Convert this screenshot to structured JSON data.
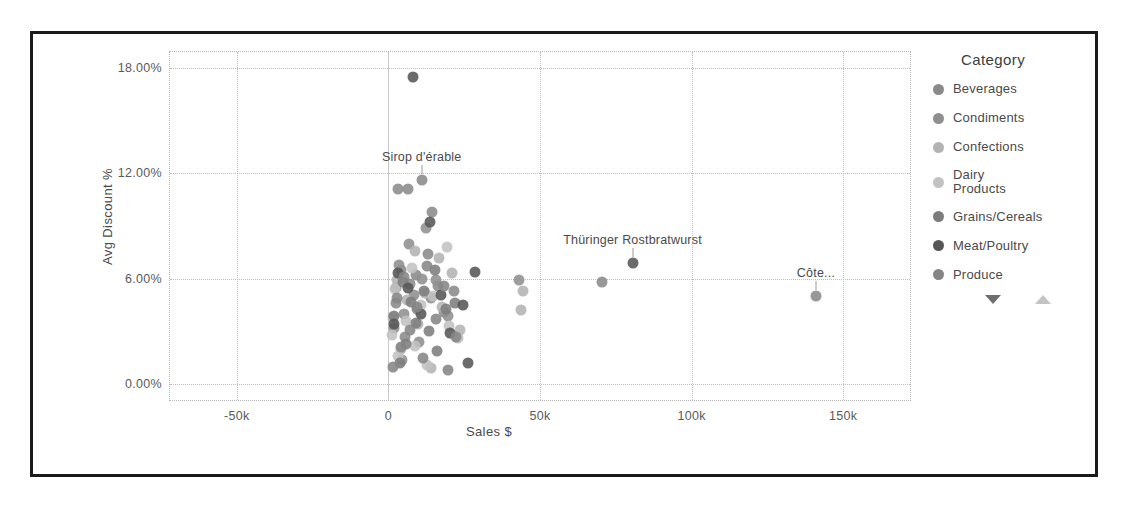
{
  "chart_data": {
    "type": "scatter",
    "title": "",
    "xlabel": "Sales $",
    "ylabel": "Avg Discount %",
    "xlim": [
      -72000,
      172000
    ],
    "ylim": [
      -0.9,
      18.9
    ],
    "grid": true,
    "legend_position": "right",
    "xticks": [
      {
        "value": -50000,
        "label": "-50k"
      },
      {
        "value": 0,
        "label": "0"
      },
      {
        "value": 50000,
        "label": "50k"
      },
      {
        "value": 100000,
        "label": "100k"
      },
      {
        "value": 150000,
        "label": "150k"
      }
    ],
    "yticks": [
      {
        "value": 0,
        "label": "0.00%"
      },
      {
        "value": 6,
        "label": "6.00%"
      },
      {
        "value": 12,
        "label": "12.00%"
      },
      {
        "value": 18,
        "label": "18.00%"
      }
    ],
    "legend": {
      "title": "Category",
      "entries": [
        {
          "name": "Beverages",
          "color": "#8a8a8a"
        },
        {
          "name": "Condiments",
          "color": "#8f8f8f"
        },
        {
          "name": "Confections",
          "color": "#b3b3b3"
        },
        {
          "name": "Dairy Products",
          "color": "#c2c2c2"
        },
        {
          "name": "Grains/Cereals",
          "color": "#7d7d7d"
        },
        {
          "name": "Meat/Poultry",
          "color": "#565656"
        },
        {
          "name": "Produce",
          "color": "#858585"
        }
      ],
      "scroll_down_arrow": "scroll-down",
      "scroll_up_arrow": "scroll-up"
    },
    "annotations": [
      {
        "text": "Sirop d'érable",
        "x": 11000,
        "y": 11.6
      },
      {
        "text": "Thüringer Rostbratwurst",
        "x": 80500,
        "y": 6.9
      },
      {
        "text": "Côte...",
        "x": 141000,
        "y": 5.0
      }
    ],
    "series": [
      {
        "name": "Beverages",
        "color": "#8a8a8a",
        "points": [
          {
            "x": 3200,
            "y": 11.1
          },
          {
            "x": 6400,
            "y": 11.1
          },
          {
            "x": 11000,
            "y": 11.6
          },
          {
            "x": 14500,
            "y": 9.8
          },
          {
            "x": 13000,
            "y": 7.4
          },
          {
            "x": 4300,
            "y": 6.5
          },
          {
            "x": 9000,
            "y": 6.2
          },
          {
            "x": 7100,
            "y": 5.7
          },
          {
            "x": 16500,
            "y": 5.6
          },
          {
            "x": 21500,
            "y": 5.3
          },
          {
            "x": 2600,
            "y": 4.6
          },
          {
            "x": 9500,
            "y": 4.3
          },
          {
            "x": 18200,
            "y": 4.1
          },
          {
            "x": 5400,
            "y": 2.7
          },
          {
            "x": 141000,
            "y": 5.0
          },
          {
            "x": 70500,
            "y": 5.8
          }
        ]
      },
      {
        "name": "Condiments",
        "color": "#8f8f8f",
        "points": [
          {
            "x": 12500,
            "y": 8.9
          },
          {
            "x": 6800,
            "y": 8.0
          },
          {
            "x": 3600,
            "y": 6.8
          },
          {
            "x": 11200,
            "y": 6.0
          },
          {
            "x": 15800,
            "y": 5.9
          },
          {
            "x": 2400,
            "y": 5.5
          },
          {
            "x": 8300,
            "y": 5.1
          },
          {
            "x": 13900,
            "y": 4.9
          },
          {
            "x": 5100,
            "y": 4.0
          },
          {
            "x": 19500,
            "y": 3.9
          },
          {
            "x": 1800,
            "y": 3.2
          },
          {
            "x": 10200,
            "y": 2.4
          },
          {
            "x": 4600,
            "y": 1.4
          },
          {
            "x": 43000,
            "y": 5.9
          }
        ]
      },
      {
        "name": "Confections",
        "color": "#b3b3b3",
        "points": [
          {
            "x": 8700,
            "y": 7.6
          },
          {
            "x": 16800,
            "y": 7.2
          },
          {
            "x": 21000,
            "y": 6.3
          },
          {
            "x": 2900,
            "y": 5.9
          },
          {
            "x": 12100,
            "y": 5.2
          },
          {
            "x": 6200,
            "y": 4.8
          },
          {
            "x": 17600,
            "y": 4.4
          },
          {
            "x": 1500,
            "y": 3.8
          },
          {
            "x": 9900,
            "y": 3.4
          },
          {
            "x": 23500,
            "y": 3.1
          },
          {
            "x": 4100,
            "y": 2.0
          },
          {
            "x": 14200,
            "y": 0.9
          },
          {
            "x": 44500,
            "y": 5.3
          },
          {
            "x": 43800,
            "y": 4.2
          }
        ]
      },
      {
        "name": "Dairy Products",
        "color": "#c2c2c2",
        "points": [
          {
            "x": 19200,
            "y": 7.8
          },
          {
            "x": 7800,
            "y": 6.6
          },
          {
            "x": 2200,
            "y": 5.4
          },
          {
            "x": 14800,
            "y": 5.0
          },
          {
            "x": 10600,
            "y": 4.5
          },
          {
            "x": 5700,
            "y": 3.6
          },
          {
            "x": 20100,
            "y": 3.3
          },
          {
            "x": 1200,
            "y": 2.8
          },
          {
            "x": 8900,
            "y": 2.2
          },
          {
            "x": 3300,
            "y": 1.6
          },
          {
            "x": 22800,
            "y": 2.6
          },
          {
            "x": 12700,
            "y": 1.1
          }
        ]
      },
      {
        "name": "Grains/Cereals",
        "color": "#7d7d7d",
        "points": [
          {
            "x": 15300,
            "y": 6.5
          },
          {
            "x": 4900,
            "y": 5.8
          },
          {
            "x": 11700,
            "y": 5.3
          },
          {
            "x": 7300,
            "y": 4.7
          },
          {
            "x": 18900,
            "y": 4.3
          },
          {
            "x": 2000,
            "y": 3.9
          },
          {
            "x": 9200,
            "y": 3.5
          },
          {
            "x": 13400,
            "y": 3.0
          },
          {
            "x": 5900,
            "y": 2.3
          },
          {
            "x": 16200,
            "y": 1.9
          },
          {
            "x": 3800,
            "y": 1.2
          },
          {
            "x": 21900,
            "y": 4.6
          }
        ]
      },
      {
        "name": "Meat/Poultry",
        "color": "#565656",
        "points": [
          {
            "x": 8200,
            "y": 17.5
          },
          {
            "x": 80500,
            "y": 6.9
          },
          {
            "x": 28500,
            "y": 6.4
          },
          {
            "x": 13800,
            "y": 9.2
          },
          {
            "x": 3100,
            "y": 6.3
          },
          {
            "x": 6600,
            "y": 5.5
          },
          {
            "x": 17200,
            "y": 5.1
          },
          {
            "x": 24600,
            "y": 4.5
          },
          {
            "x": 10800,
            "y": 4.0
          },
          {
            "x": 1900,
            "y": 3.4
          },
          {
            "x": 20400,
            "y": 2.9
          },
          {
            "x": 26200,
            "y": 1.2
          }
        ]
      },
      {
        "name": "Produce",
        "color": "#858585",
        "points": [
          {
            "x": 12900,
            "y": 6.7
          },
          {
            "x": 5300,
            "y": 6.1
          },
          {
            "x": 18500,
            "y": 5.6
          },
          {
            "x": 2700,
            "y": 4.9
          },
          {
            "x": 9600,
            "y": 4.4
          },
          {
            "x": 15600,
            "y": 3.7
          },
          {
            "x": 7000,
            "y": 3.1
          },
          {
            "x": 22300,
            "y": 2.7
          },
          {
            "x": 4200,
            "y": 2.1
          },
          {
            "x": 11400,
            "y": 1.5
          },
          {
            "x": 19800,
            "y": 0.8
          },
          {
            "x": 1400,
            "y": 1.0
          }
        ]
      }
    ]
  }
}
